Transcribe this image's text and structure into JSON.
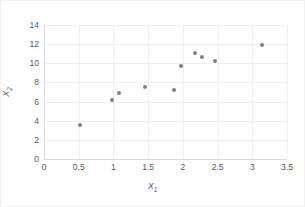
{
  "chart_data": {
    "type": "scatter",
    "title": "",
    "xlabel": "X₁",
    "ylabel": "X₂",
    "xlabel_base": "X",
    "xlabel_sub": "1",
    "ylabel_base": "X",
    "ylabel_sub": "2",
    "xlim": [
      0,
      3.5
    ],
    "ylim": [
      0,
      14
    ],
    "xticks": [
      0,
      0.5,
      1,
      1.5,
      2,
      2.5,
      3,
      3.5
    ],
    "xtick_labels": [
      "0",
      "0.5",
      "1",
      "1.5",
      "2",
      "2.5",
      "3",
      "3.5"
    ],
    "yticks": [
      0,
      2,
      4,
      6,
      8,
      10,
      12,
      14
    ],
    "ytick_labels": [
      "0",
      "2",
      "4",
      "6",
      "8",
      "10",
      "12",
      "14"
    ],
    "grid": true,
    "legend": false,
    "marker_color": "#808080",
    "grid_color": "#f0f0f0",
    "axis_color": "#d9d9d9",
    "tick_text_color": "#595959",
    "background": "#ffffff",
    "points": [
      {
        "x": 0.52,
        "y": 3.6
      },
      {
        "x": 0.98,
        "y": 6.15
      },
      {
        "x": 1.08,
        "y": 6.9
      },
      {
        "x": 1.45,
        "y": 7.55
      },
      {
        "x": 1.87,
        "y": 7.2
      },
      {
        "x": 1.97,
        "y": 9.75
      },
      {
        "x": 2.17,
        "y": 11.05
      },
      {
        "x": 2.28,
        "y": 10.65
      },
      {
        "x": 2.47,
        "y": 10.25
      },
      {
        "x": 3.14,
        "y": 11.95
      }
    ]
  }
}
